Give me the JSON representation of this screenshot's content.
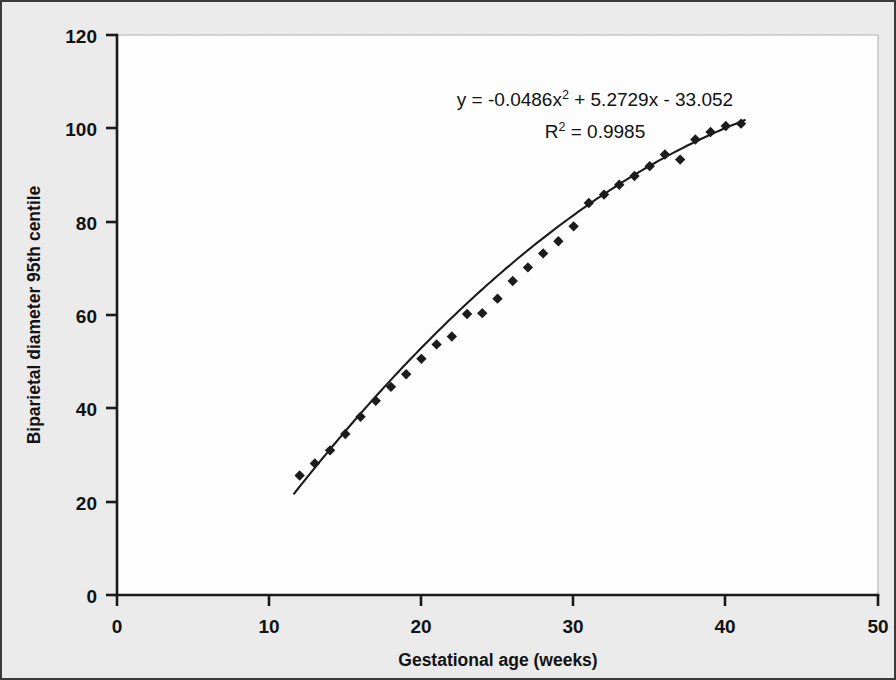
{
  "figure": {
    "background_color": "#ececed",
    "plot_background_color": "#ffffff",
    "border_color": "#3a3a3a"
  },
  "annotations": {
    "equation_prefix": "y = -0.0486x",
    "equation_sup": "2",
    "equation_suffix": " + 5.2729x - 33.052",
    "r2_prefix": "R",
    "r2_sup": "2",
    "r2_suffix": " = 0.9985"
  },
  "chart_data": {
    "type": "scatter",
    "title": "",
    "xlabel": "Gestational age (weeks)",
    "ylabel": "Biparietal diameter 95th centile",
    "xlim": [
      0,
      50
    ],
    "ylim": [
      0,
      120
    ],
    "xticks": [
      0,
      10,
      20,
      30,
      40,
      50
    ],
    "yticks": [
      0,
      20,
      40,
      60,
      80,
      100,
      120
    ],
    "grid": false,
    "legend": "none",
    "marker": "diamond",
    "marker_color": "#1c1c1c",
    "line_color": "#1b1b1b",
    "fit": {
      "type": "polynomial",
      "degree": 2,
      "equation": "y = -0.0486x^2 + 5.2729x - 33.052",
      "coefficients": [
        -0.0486,
        5.2729,
        -33.052
      ],
      "r_squared": 0.9985,
      "x_range": [
        11.6,
        41.3
      ]
    },
    "series": [
      {
        "name": "Biparietal diameter 95th centile",
        "x": [
          12,
          13,
          14,
          15,
          16,
          17,
          18,
          19,
          20,
          21,
          22,
          23,
          24,
          25,
          26,
          27,
          28,
          29,
          30,
          31,
          32,
          33,
          34,
          35,
          36,
          37,
          38,
          39,
          40,
          41
        ],
        "y": [
          25.6,
          28.2,
          31.0,
          34.5,
          38.2,
          41.6,
          44.6,
          47.3,
          50.6,
          53.7,
          55.4,
          60.2,
          60.4,
          63.5,
          67.3,
          70.2,
          73.2,
          75.8,
          79.0,
          84.0,
          85.8,
          87.9,
          89.8,
          91.9,
          94.4,
          93.3,
          97.6,
          99.2,
          100.5,
          101.0
        ]
      }
    ]
  }
}
